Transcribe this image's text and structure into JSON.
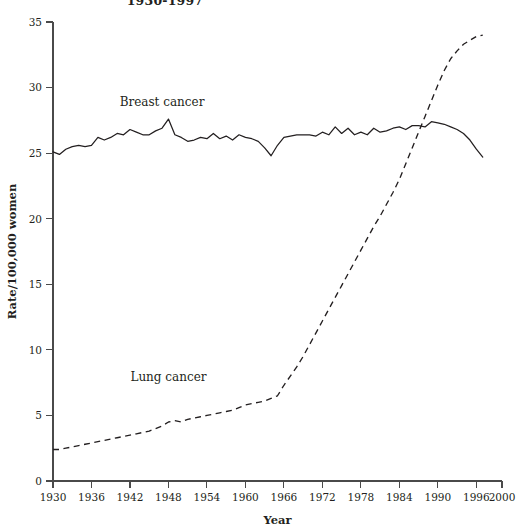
{
  "figure": {
    "title": "1930-1997",
    "background": "#ffffff",
    "ink_color": "#231f20",
    "width": 522,
    "height": 531
  },
  "chart_data": {
    "type": "line",
    "title": "1930-1997",
    "xlabel": "Year",
    "ylabel": "Rate/100,000 women",
    "xlim": [
      1930,
      2000
    ],
    "ylim": [
      0,
      35
    ],
    "xticks": [
      1930,
      1936,
      1942,
      1948,
      1954,
      1960,
      1966,
      1972,
      1978,
      1984,
      1990,
      1996,
      2000
    ],
    "yticks": [
      0,
      5,
      10,
      15,
      20,
      25,
      30,
      35
    ],
    "grid": false,
    "legend": "inline-annotations",
    "annotations": [
      {
        "text": "Breast cancer",
        "x": 1947,
        "y": 28.6
      },
      {
        "text": "Lung cancer",
        "x": 1948,
        "y": 7.6
      }
    ],
    "x": [
      1930,
      1931,
      1932,
      1933,
      1934,
      1935,
      1936,
      1937,
      1938,
      1939,
      1940,
      1941,
      1942,
      1943,
      1944,
      1945,
      1946,
      1947,
      1948,
      1949,
      1950,
      1951,
      1952,
      1953,
      1954,
      1955,
      1956,
      1957,
      1958,
      1959,
      1960,
      1961,
      1962,
      1963,
      1964,
      1965,
      1966,
      1967,
      1968,
      1969,
      1970,
      1971,
      1972,
      1973,
      1974,
      1975,
      1976,
      1977,
      1978,
      1979,
      1980,
      1981,
      1982,
      1983,
      1984,
      1985,
      1986,
      1987,
      1988,
      1989,
      1990,
      1991,
      1992,
      1993,
      1994,
      1995,
      1996,
      1997
    ],
    "series": [
      {
        "name": "Breast cancer",
        "style": "solid",
        "values": [
          25.1,
          24.9,
          25.3,
          25.5,
          25.6,
          25.5,
          25.6,
          26.2,
          26.0,
          26.2,
          26.5,
          26.4,
          26.8,
          26.6,
          26.4,
          26.4,
          26.7,
          26.9,
          27.6,
          26.4,
          26.2,
          25.9,
          26.0,
          26.2,
          26.1,
          26.5,
          26.1,
          26.3,
          26.0,
          26.4,
          26.2,
          26.1,
          25.9,
          25.4,
          24.8,
          25.6,
          26.2,
          26.3,
          26.4,
          26.4,
          26.4,
          26.3,
          26.6,
          26.4,
          27.0,
          26.5,
          26.9,
          26.4,
          26.6,
          26.4,
          26.9,
          26.6,
          26.7,
          26.9,
          27.0,
          26.8,
          27.1,
          27.1,
          27.0,
          27.4,
          27.3,
          27.2,
          27.0,
          26.8,
          26.5,
          26.0,
          25.3,
          24.7
        ]
      },
      {
        "name": "Lung cancer",
        "style": "dashed",
        "values": [
          2.4,
          2.4,
          2.5,
          2.6,
          2.7,
          2.8,
          2.9,
          3.0,
          3.1,
          3.2,
          3.3,
          3.4,
          3.5,
          3.6,
          3.7,
          3.8,
          4.0,
          4.2,
          4.5,
          4.6,
          4.5,
          4.7,
          4.8,
          4.9,
          5.0,
          5.1,
          5.2,
          5.3,
          5.4,
          5.6,
          5.8,
          5.9,
          6.0,
          6.1,
          6.3,
          6.5,
          7.3,
          8.0,
          8.7,
          9.5,
          10.4,
          11.3,
          12.2,
          13.1,
          14.0,
          14.9,
          15.8,
          16.7,
          17.6,
          18.5,
          19.4,
          20.2,
          21.1,
          22.0,
          23.0,
          24.2,
          25.4,
          26.6,
          27.8,
          29.0,
          30.2,
          31.3,
          32.2,
          32.8,
          33.3,
          33.6,
          33.9,
          34.0
        ]
      }
    ]
  }
}
